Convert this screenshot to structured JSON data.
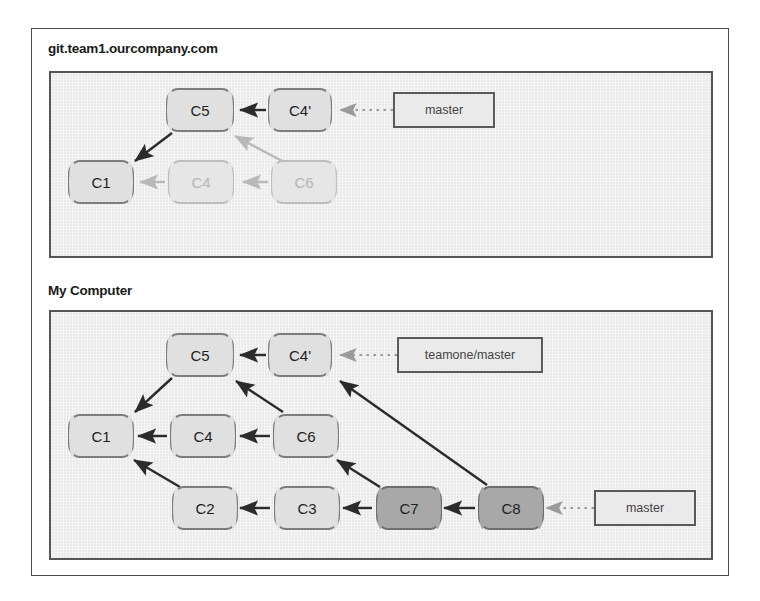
{
  "figure": {
    "kind": "git-history-diagram",
    "background": "#ffffff",
    "frame_border_color": "#4a4a4a",
    "panel_fill": "#e9e9e9",
    "panel_border_color": "#555555"
  },
  "panels": [
    {
      "id": "remote",
      "title": "git.team1.ourcompany.com",
      "commits": [
        {
          "id": "c5",
          "label": "C5",
          "style": "normal"
        },
        {
          "id": "c4p",
          "label": "C4'",
          "style": "normal"
        },
        {
          "id": "c1",
          "label": "C1",
          "style": "normal"
        },
        {
          "id": "c4",
          "label": "C4",
          "style": "faded"
        },
        {
          "id": "c6",
          "label": "C6",
          "style": "faded"
        }
      ],
      "refs": [
        {
          "id": "master",
          "label": "master",
          "points_to": "c4p"
        }
      ],
      "edges": [
        {
          "from": "c4p",
          "to": "c5",
          "style": "solid-dark"
        },
        {
          "from": "c5",
          "to": "c1",
          "style": "solid-dark"
        },
        {
          "from": "c4",
          "to": "c1",
          "style": "solid-light"
        },
        {
          "from": "c6",
          "to": "c4",
          "style": "solid-light"
        },
        {
          "from": "c6",
          "to": "c5",
          "style": "solid-light"
        }
      ]
    },
    {
      "id": "local",
      "title": "My Computer",
      "commits": [
        {
          "id": "c5",
          "label": "C5",
          "style": "normal"
        },
        {
          "id": "c4p",
          "label": "C4'",
          "style": "normal"
        },
        {
          "id": "c1",
          "label": "C1",
          "style": "normal"
        },
        {
          "id": "c4",
          "label": "C4",
          "style": "normal"
        },
        {
          "id": "c6",
          "label": "C6",
          "style": "normal"
        },
        {
          "id": "c2",
          "label": "C2",
          "style": "normal"
        },
        {
          "id": "c3",
          "label": "C3",
          "style": "normal"
        },
        {
          "id": "c7",
          "label": "C7",
          "style": "dark"
        },
        {
          "id": "c8",
          "label": "C8",
          "style": "dark"
        }
      ],
      "refs": [
        {
          "id": "teamone-master",
          "label": "teamone/master",
          "points_to": "c4p"
        },
        {
          "id": "master",
          "label": "master",
          "points_to": "c8"
        }
      ],
      "edges": [
        {
          "from": "c4p",
          "to": "c5",
          "style": "solid-dark"
        },
        {
          "from": "c5",
          "to": "c1",
          "style": "solid-dark"
        },
        {
          "from": "c4",
          "to": "c1",
          "style": "solid-dark"
        },
        {
          "from": "c6",
          "to": "c4",
          "style": "solid-dark"
        },
        {
          "from": "c6",
          "to": "c5",
          "style": "solid-dark"
        },
        {
          "from": "c2",
          "to": "c1",
          "style": "solid-dark"
        },
        {
          "from": "c3",
          "to": "c2",
          "style": "solid-dark"
        },
        {
          "from": "c7",
          "to": "c3",
          "style": "solid-dark"
        },
        {
          "from": "c7",
          "to": "c6",
          "style": "solid-dark"
        },
        {
          "from": "c8",
          "to": "c7",
          "style": "solid-dark"
        },
        {
          "from": "c8",
          "to": "c4p",
          "style": "solid-dark"
        }
      ]
    }
  ],
  "colors": {
    "commit_normal_fill": "#e0e0e0",
    "commit_normal_border": "#7d7d7d",
    "commit_faded_fill": "#e6e6e6",
    "commit_faded_border": "#bdbdbd",
    "commit_faded_text": "#b5b5b5",
    "commit_dark_fill": "#a8a8a8",
    "commit_dark_border": "#6e6e6e",
    "edge_dark": "#2b2b2b",
    "edge_light": "#b9b9b9",
    "ref_arrow": "#9a9a9a",
    "ref_border": "#5a5a5a",
    "title_text": "#1a1a1a"
  }
}
